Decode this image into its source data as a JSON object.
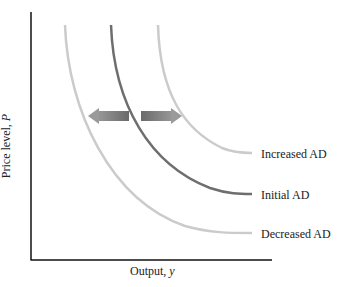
{
  "chart_data": {
    "type": "line",
    "title": "",
    "xlabel": "Output, y",
    "ylabel": "Price level, P",
    "grid": false,
    "legend_position": "inline-right",
    "series": [
      {
        "name": "Increased AD",
        "color": "#c8c8c8",
        "shift": "right"
      },
      {
        "name": "Initial AD",
        "color": "#6e6e6e",
        "shift": "none"
      },
      {
        "name": "Decreased AD",
        "color": "#c8c8c8",
        "shift": "left"
      }
    ],
    "annotations": [
      {
        "type": "arrow",
        "direction": "left",
        "color": "#8a8a8a",
        "meaning": "decrease in aggregate demand"
      },
      {
        "type": "arrow",
        "direction": "right",
        "color": "#8a8a8a",
        "meaning": "increase in aggregate demand"
      }
    ]
  },
  "labels": {
    "increased": "Increased AD",
    "initial": "Initial AD",
    "decreased": "Decreased AD",
    "xlabel": "Output, y",
    "ylabel": "Price level, P"
  }
}
